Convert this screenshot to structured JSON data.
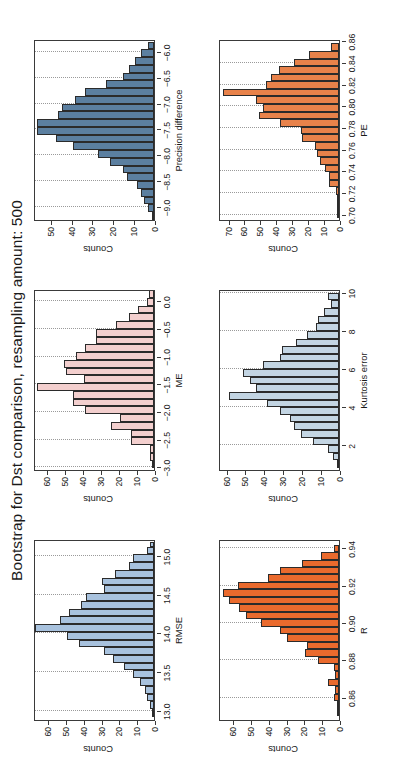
{
  "figure": {
    "title": "Bootstrap for Dst comparison, resampling amount: 500",
    "ylabel_common": "Counts"
  },
  "chart_data": [
    {
      "id": "precision-difference",
      "type": "bar",
      "title": "",
      "xlabel": "Precision difference",
      "ylabel": "Counts",
      "color": "#5b7fa0",
      "edge": "#2b2b2b",
      "xlim": [
        -9.25,
        -5.75
      ],
      "ylim": [
        0,
        58
      ],
      "xticks": [
        -9.0,
        -8.5,
        -8.0,
        -7.5,
        -7.0,
        -6.5,
        -6.0
      ],
      "xtick_labels": [
        "−9.0",
        "−8.5",
        "−8.0",
        "−7.5",
        "−7.0",
        "−6.5",
        "−6.0"
      ],
      "yticks": [
        0,
        10,
        20,
        30,
        40,
        50
      ],
      "ytick_labels": [
        "0",
        "10",
        "20",
        "30",
        "40",
        "50"
      ],
      "grid": true,
      "bin_edges": [
        -9.25,
        -9.1,
        -8.95,
        -8.8,
        -8.65,
        -8.5,
        -8.35,
        -8.2,
        -8.05,
        -7.9,
        -7.75,
        -7.6,
        -7.45,
        -7.3,
        -7.15,
        -7.0,
        -6.85,
        -6.7,
        -6.55,
        -6.4,
        -6.25,
        -6.1,
        -5.95,
        -5.8
      ],
      "x": [
        -9.175,
        -9.025,
        -8.875,
        -8.725,
        -8.575,
        -8.425,
        -8.275,
        -8.125,
        -7.975,
        -7.825,
        -7.675,
        -7.525,
        -7.375,
        -7.225,
        -7.075,
        -6.925,
        -6.775,
        -6.625,
        -6.475,
        -6.325,
        -6.175,
        -6.025,
        -5.875
      ],
      "values": [
        1,
        3,
        5,
        6,
        8,
        13,
        15,
        21,
        27,
        39,
        47,
        56,
        56,
        46,
        44,
        38,
        33,
        23,
        15,
        12,
        9,
        6,
        3
      ]
    },
    {
      "id": "pe",
      "type": "bar",
      "title": "",
      "xlabel": "PE",
      "ylabel": "Counts",
      "color": "#e8824a",
      "edge": "#2b2b2b",
      "xlim": [
        0.695,
        0.862
      ],
      "ylim": [
        0,
        76
      ],
      "xticks": [
        0.7,
        0.72,
        0.74,
        0.76,
        0.78,
        0.8,
        0.82,
        0.84,
        0.86
      ],
      "xtick_labels": [
        "0.70",
        "0.72",
        "0.74",
        "0.76",
        "0.78",
        "0.80",
        "0.82",
        "0.84",
        "0.86"
      ],
      "yticks": [
        0,
        10,
        20,
        30,
        40,
        50,
        60,
        70
      ],
      "ytick_labels": [
        "0",
        "10",
        "20",
        "30",
        "40",
        "50",
        "60",
        "70"
      ],
      "grid": true,
      "bin_edges": [
        0.697,
        0.704,
        0.711,
        0.718,
        0.725,
        0.732,
        0.739,
        0.746,
        0.753,
        0.76,
        0.767,
        0.774,
        0.781,
        0.788,
        0.795,
        0.802,
        0.809,
        0.816,
        0.823,
        0.83,
        0.837,
        0.844,
        0.851,
        0.858
      ],
      "x": [
        0.7005,
        0.7075,
        0.7145,
        0.7215,
        0.7285,
        0.7355,
        0.7425,
        0.7495,
        0.7565,
        0.7635,
        0.7705,
        0.7775,
        0.7845,
        0.7915,
        0.7985,
        0.8055,
        0.8125,
        0.8195,
        0.8265,
        0.8335,
        0.8405,
        0.8475,
        0.8545
      ],
      "values": [
        1,
        1,
        1,
        2,
        6,
        6,
        9,
        12,
        14,
        15,
        23,
        24,
        37,
        50,
        48,
        52,
        73,
        46,
        43,
        38,
        28,
        19,
        5
      ]
    },
    {
      "id": "me",
      "type": "bar",
      "title": "",
      "xlabel": "ME",
      "ylabel": "Counts",
      "color": "#f3cfce",
      "edge": "#2b2b2b",
      "xlim": [
        -3.05,
        0.22
      ],
      "ylim": [
        0,
        67
      ],
      "xticks": [
        -3.0,
        -2.5,
        -2.0,
        -1.5,
        -1.0,
        -0.5,
        0.0
      ],
      "xtick_labels": [
        "−3.0",
        "−2.5",
        "−2.0",
        "−1.5",
        "−1.0",
        "−0.5",
        "0.0"
      ],
      "yticks": [
        0,
        10,
        20,
        30,
        40,
        50,
        60
      ],
      "ytick_labels": [
        "0",
        "10",
        "20",
        "30",
        "40",
        "50",
        "60"
      ],
      "grid": true,
      "bin_edges": [
        -3.02,
        -2.88,
        -2.74,
        -2.6,
        -2.46,
        -2.32,
        -2.18,
        -2.04,
        -1.9,
        -1.76,
        -1.62,
        -1.48,
        -1.34,
        -1.2,
        -1.06,
        -0.92,
        -0.78,
        -0.64,
        -0.5,
        -0.36,
        -0.22,
        -0.08,
        0.06,
        0.2
      ],
      "x": [
        -2.95,
        -2.81,
        -2.67,
        -2.53,
        -2.39,
        -2.25,
        -2.11,
        -1.97,
        -1.83,
        -1.69,
        -1.55,
        -1.41,
        -1.27,
        -1.13,
        -0.99,
        -0.85,
        -0.71,
        -0.57,
        -0.43,
        -0.29,
        -0.15,
        -0.01,
        0.13
      ],
      "values": [
        1,
        2,
        2,
        13,
        13,
        24,
        19,
        38,
        45,
        45,
        65,
        39,
        49,
        50,
        43,
        38,
        32,
        32,
        21,
        14,
        9,
        4,
        3
      ]
    },
    {
      "id": "kurtosis-error",
      "type": "bar",
      "title": "",
      "xlabel": "Kurtosis error",
      "ylabel": "Counts",
      "color": "#c3d5e3",
      "edge": "#2b2b2b",
      "xlim": [
        0.7,
        10.2
      ],
      "ylim": [
        0,
        64
      ],
      "xticks": [
        2,
        4,
        6,
        8,
        10
      ],
      "xtick_labels": [
        "2",
        "4",
        "6",
        "8",
        "10"
      ],
      "yticks": [
        0,
        10,
        20,
        30,
        40,
        50,
        60
      ],
      "ytick_labels": [
        "0",
        "10",
        "20",
        "30",
        "40",
        "50",
        "60"
      ],
      "grid": true,
      "bin_edges": [
        0.8,
        1.2,
        1.6,
        2.0,
        2.4,
        2.8,
        3.2,
        3.6,
        4.0,
        4.4,
        4.8,
        5.2,
        5.6,
        6.0,
        6.4,
        6.8,
        7.2,
        7.6,
        8.0,
        8.4,
        8.8,
        9.2,
        9.6,
        10.0
      ],
      "x": [
        1.0,
        1.4,
        1.8,
        2.2,
        2.6,
        3.0,
        3.4,
        3.8,
        4.2,
        4.6,
        5.0,
        5.4,
        5.8,
        6.2,
        6.6,
        7.0,
        7.4,
        7.8,
        8.2,
        8.6,
        9.0,
        9.4,
        9.8
      ],
      "values": [
        1,
        3,
        6,
        14,
        20,
        24,
        26,
        31,
        38,
        58,
        44,
        47,
        51,
        40,
        31,
        30,
        23,
        17,
        12,
        11,
        8,
        4,
        6
      ]
    },
    {
      "id": "rmse",
      "type": "bar",
      "title": "",
      "xlabel": "RMSE",
      "ylabel": "Counts",
      "color": "#a8c2de",
      "edge": "#2b2b2b",
      "xlim": [
        12.88,
        15.22
      ],
      "ylim": [
        0,
        68
      ],
      "xticks": [
        13.0,
        13.5,
        14.0,
        14.5,
        15.0
      ],
      "xtick_labels": [
        "13.0",
        "13.5",
        "14.0",
        "14.5",
        "15.0"
      ],
      "yticks": [
        0,
        10,
        20,
        30,
        40,
        50,
        60
      ],
      "ytick_labels": [
        "0",
        "10",
        "20",
        "30",
        "40",
        "50",
        "60"
      ],
      "grid": true,
      "bin_edges": [
        12.92,
        13.02,
        13.12,
        13.22,
        13.32,
        13.42,
        13.52,
        13.62,
        13.72,
        13.82,
        13.92,
        14.02,
        14.12,
        14.22,
        14.32,
        14.42,
        14.52,
        14.62,
        14.72,
        14.82,
        14.92,
        15.02,
        15.12,
        15.18
      ],
      "x": [
        12.97,
        13.07,
        13.17,
        13.27,
        13.37,
        13.47,
        13.57,
        13.67,
        13.77,
        13.87,
        13.97,
        14.07,
        14.17,
        14.27,
        14.37,
        14.47,
        14.57,
        14.67,
        14.77,
        14.87,
        14.97,
        15.07,
        15.15
      ],
      "values": [
        1,
        2,
        4,
        5,
        8,
        12,
        17,
        23,
        28,
        42,
        49,
        67,
        53,
        48,
        41,
        38,
        28,
        29,
        22,
        14,
        12,
        4,
        2
      ]
    },
    {
      "id": "r",
      "type": "bar",
      "title": "",
      "xlabel": "R",
      "ylabel": "Counts",
      "color": "#ea6a2d",
      "edge": "#2b2b2b",
      "xlim": [
        0.848,
        0.945
      ],
      "ylim": [
        0,
        68
      ],
      "xticks": [
        0.86,
        0.88,
        0.9,
        0.92,
        0.94
      ],
      "xtick_labels": [
        "0.86",
        "0.88",
        "0.90",
        "0.92",
        "0.94"
      ],
      "yticks": [
        0,
        10,
        20,
        30,
        40,
        50,
        60
      ],
      "ytick_labels": [
        "0",
        "10",
        "20",
        "30",
        "40",
        "50",
        "60"
      ],
      "grid": true,
      "bin_edges": [
        0.85,
        0.854,
        0.858,
        0.862,
        0.866,
        0.87,
        0.874,
        0.878,
        0.882,
        0.886,
        0.89,
        0.894,
        0.898,
        0.902,
        0.906,
        0.91,
        0.914,
        0.918,
        0.922,
        0.926,
        0.93,
        0.934,
        0.938,
        0.942
      ],
      "x": [
        0.852,
        0.856,
        0.86,
        0.864,
        0.868,
        0.872,
        0.876,
        0.88,
        0.884,
        0.888,
        0.892,
        0.896,
        0.9,
        0.904,
        0.908,
        0.912,
        0.916,
        0.92,
        0.924,
        0.928,
        0.932,
        0.936,
        0.94
      ],
      "values": [
        1,
        1,
        3,
        2,
        6,
        2,
        3,
        12,
        19,
        18,
        29,
        33,
        44,
        52,
        56,
        62,
        65,
        57,
        40,
        33,
        21,
        10,
        3
      ]
    }
  ],
  "panel_order": [
    "precision-difference",
    "pe",
    "me",
    "kurtosis-error",
    "rmse",
    "r"
  ]
}
